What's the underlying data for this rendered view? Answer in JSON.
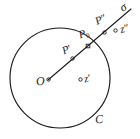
{
  "figure": {
    "type": "geometry-diagram",
    "background_color": "#ffffff",
    "stroke_color": "#1b1b1b",
    "labels": {
      "center": "O",
      "circle": "C",
      "point_inside": "P",
      "point_inside_prime": "′",
      "point_on_circle": "P",
      "point_on_circle_sub": "0",
      "point_outside": "P",
      "point_outside_prime": "″",
      "ray_end": "σ",
      "value_inside": "z",
      "value_inside_prime": "′",
      "value_outside": "z",
      "value_outside_prime": "″"
    },
    "geometry": {
      "circle": {
        "cx": 60,
        "cy": 78,
        "r": 50
      },
      "ray": {
        "x1": 48,
        "y1": 80,
        "x2": 132,
        "y2": 8
      },
      "points": [
        {
          "name": "O",
          "x": 48,
          "y": 80
        },
        {
          "name": "P'",
          "x": 73,
          "y": 58
        },
        {
          "name": "P0",
          "x": 88,
          "y": 46
        },
        {
          "name": "P\"",
          "x": 104,
          "y": 32
        },
        {
          "name": "z'",
          "x": 81,
          "y": 79
        },
        {
          "name": "z\"",
          "x": 116,
          "y": 30
        }
      ]
    }
  }
}
